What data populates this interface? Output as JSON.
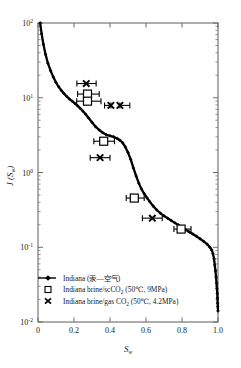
{
  "figure": {
    "background": "#ffffff",
    "frame_color": "#6b6b6b",
    "curve_color": "#000000",
    "marker_color": "#000000"
  },
  "axes": {
    "x": {
      "label": "S",
      "label_sub": "w",
      "ticks": [
        "0",
        "0.2",
        "0.4",
        "0.6",
        "0.8",
        "1.0"
      ],
      "tick_values": [
        0,
        0.2,
        0.4,
        0.6,
        0.8,
        1.0
      ],
      "range": [
        0,
        1.0
      ],
      "scale": "linear"
    },
    "y": {
      "label": "J (S",
      "label_sub": "w",
      "label_close": ")",
      "ticks": [
        "10",
        "10",
        "10",
        "10",
        "10"
      ],
      "tick_exponents": [
        "2",
        "1",
        "0",
        "-1",
        "-2"
      ],
      "tick_values": [
        100,
        10,
        1,
        0.1,
        0.01
      ],
      "range": [
        0.01,
        100
      ],
      "scale": "log"
    }
  },
  "legend": {
    "position": "lower-left-inside",
    "entries": [
      {
        "marker": "line-dot",
        "label": "Indiana (汞—空气)"
      },
      {
        "marker": "open-square",
        "label_pre": "Indiana brine/scCO",
        "label_sub": "2",
        "label_post": " (50℃, 9MPa)"
      },
      {
        "marker": "cross-x",
        "label_pre": "Indiana brine/gas CO",
        "label_sub": "2",
        "label_post": " (50℃, 4.2MPa)"
      }
    ]
  },
  "chart_data": {
    "type": "line",
    "title": "",
    "xlabel": "Sw",
    "ylabel": "J(Sw)",
    "xlim": [
      0,
      1.0
    ],
    "ylim": [
      0.01,
      100
    ],
    "yscale": "log",
    "xscale": "linear",
    "grid": false,
    "legend_position": "lower left",
    "series": [
      {
        "name": "Indiana (汞—空气)",
        "type": "line-with-markers",
        "marker": "small-filled-diamond",
        "x": [
          0.012,
          0.02,
          0.03,
          0.042,
          0.055,
          0.07,
          0.085,
          0.1,
          0.115,
          0.13,
          0.145,
          0.16,
          0.175,
          0.19,
          0.205,
          0.22,
          0.235,
          0.25,
          0.265,
          0.28,
          0.3,
          0.32,
          0.34,
          0.36,
          0.38,
          0.4,
          0.42,
          0.44,
          0.455,
          0.47,
          0.485,
          0.5,
          0.515,
          0.53,
          0.545,
          0.56,
          0.575,
          0.59,
          0.605,
          0.62,
          0.64,
          0.66,
          0.68,
          0.7,
          0.72,
          0.74,
          0.76,
          0.78,
          0.8,
          0.82,
          0.84,
          0.86,
          0.88,
          0.9,
          0.92,
          0.94,
          0.955,
          0.965,
          0.972,
          0.978,
          0.982,
          0.986,
          0.989,
          0.992,
          0.994,
          0.996,
          0.997,
          0.998,
          0.999,
          1.0
        ],
        "y": [
          100.0,
          72.0,
          52.0,
          38.0,
          29.0,
          23.0,
          19.0,
          16.0,
          14.0,
          12.5,
          11.3,
          10.4,
          9.6,
          9.0,
          8.4,
          7.8,
          7.2,
          6.6,
          6.0,
          5.4,
          4.7,
          4.1,
          3.7,
          3.4,
          3.2,
          3.1,
          3.0,
          2.85,
          2.7,
          2.5,
          2.2,
          1.85,
          1.5,
          1.15,
          0.9,
          0.72,
          0.6,
          0.52,
          0.46,
          0.41,
          0.355,
          0.315,
          0.285,
          0.263,
          0.245,
          0.228,
          0.212,
          0.198,
          0.185,
          0.172,
          0.16,
          0.15,
          0.14,
          0.13,
          0.12,
          0.11,
          0.1,
          0.092,
          0.082,
          0.07,
          0.058,
          0.048,
          0.04,
          0.033,
          0.028,
          0.024,
          0.021,
          0.018,
          0.016,
          0.014
        ]
      },
      {
        "name": "Indiana brine/scCO2 (50℃, 9MPa)",
        "type": "scatter-errorbar",
        "marker": "open-square",
        "points": [
          {
            "x": 0.275,
            "y": 11.2,
            "xerr_low": 0.055,
            "xerr_high": 0.065
          },
          {
            "x": 0.275,
            "y": 9.0,
            "xerr_low": 0.06,
            "xerr_high": 0.075
          },
          {
            "x": 0.365,
            "y": 2.62,
            "xerr_low": 0.055,
            "xerr_high": 0.06
          },
          {
            "x": 0.535,
            "y": 0.455,
            "xerr_low": 0.045,
            "xerr_high": 0.055
          },
          {
            "x": 0.795,
            "y": 0.175,
            "xerr_low": 0.04,
            "xerr_high": 0.055
          }
        ]
      },
      {
        "name": "Indiana brine/gas CO2 (50℃, 4.2MPa)",
        "type": "scatter-errorbar",
        "marker": "cross-x",
        "points": [
          {
            "x": 0.268,
            "y": 15.5,
            "xerr_low": 0.052,
            "xerr_high": 0.055
          },
          {
            "x": 0.405,
            "y": 7.9,
            "xerr_low": 0.035,
            "xerr_high": 0.0
          },
          {
            "x": 0.455,
            "y": 7.9,
            "xerr_low": 0.0,
            "xerr_high": 0.055
          },
          {
            "x": 0.345,
            "y": 1.58,
            "xerr_low": 0.055,
            "xerr_high": 0.055
          },
          {
            "x": 0.635,
            "y": 0.245,
            "xerr_low": 0.055,
            "xerr_high": 0.055
          }
        ]
      }
    ]
  }
}
